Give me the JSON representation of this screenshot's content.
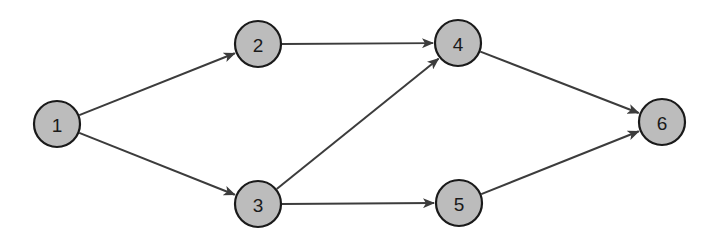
{
  "diagram": {
    "type": "directed-graph",
    "colors": {
      "node_fill": "#bcbcbc",
      "node_stroke": "#1a1a1a",
      "edge": "#3c3c3c",
      "background": "#ffffff"
    },
    "nodes": [
      {
        "id": "1",
        "label": "1",
        "cx": 57,
        "cy": 124
      },
      {
        "id": "2",
        "label": "2",
        "cx": 258,
        "cy": 44
      },
      {
        "id": "3",
        "label": "3",
        "cx": 258,
        "cy": 204
      },
      {
        "id": "4",
        "label": "4",
        "cx": 458,
        "cy": 43
      },
      {
        "id": "5",
        "label": "5",
        "cx": 459,
        "cy": 203
      },
      {
        "id": "6",
        "label": "6",
        "cx": 662,
        "cy": 122
      }
    ],
    "edges": [
      {
        "from": "1",
        "to": "2"
      },
      {
        "from": "1",
        "to": "3"
      },
      {
        "from": "2",
        "to": "4"
      },
      {
        "from": "3",
        "to": "4"
      },
      {
        "from": "3",
        "to": "5"
      },
      {
        "from": "4",
        "to": "6"
      },
      {
        "from": "5",
        "to": "6"
      }
    ]
  }
}
